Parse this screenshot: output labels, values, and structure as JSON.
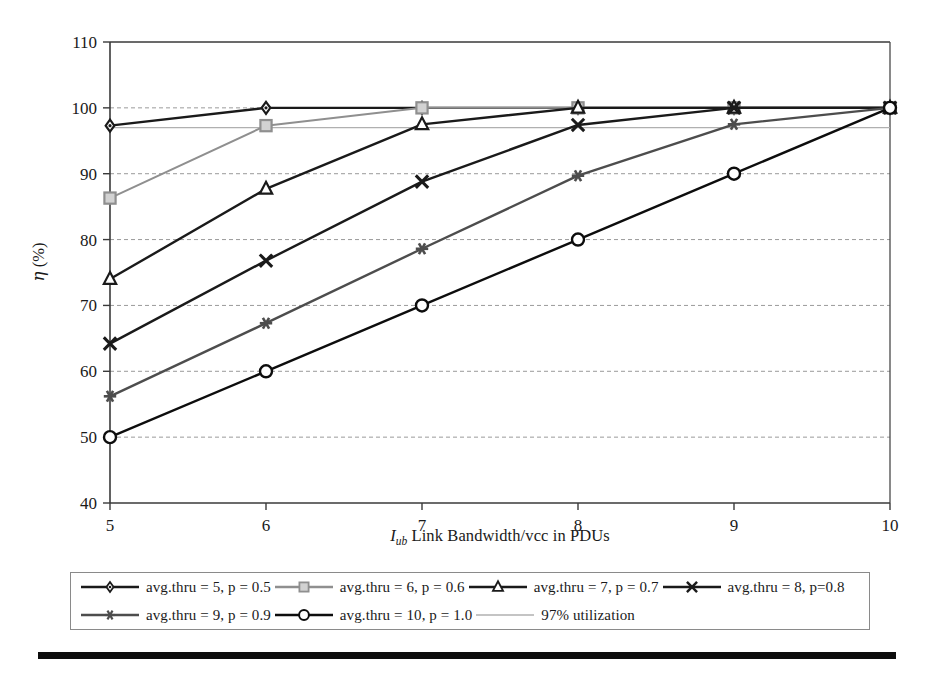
{
  "chart_data": {
    "type": "line",
    "title": "",
    "xlabel": "I_ub Link Bandwidth/vcc in PDUs",
    "xlabel_parts": {
      "italic": "I",
      "subscript": "ub",
      "rest": " Link Bandwidth/vcc in PDUs"
    },
    "ylabel": "η (%)",
    "ylabel_parts": {
      "symbol": "η",
      "unit": " (%)"
    },
    "x": [
      5,
      6,
      7,
      8,
      9,
      10
    ],
    "xlim": [
      5,
      10
    ],
    "ylim": [
      40,
      110
    ],
    "xticks": [
      "5",
      "6",
      "7",
      "8",
      "9",
      "10"
    ],
    "yticks": [
      "40",
      "50",
      "60",
      "70",
      "80",
      "90",
      "100",
      "110"
    ],
    "grid": "horizontal",
    "legend_position": "bottom",
    "series": [
      {
        "name": "avg.thru = 5, p = 0.5",
        "marker": "diamond",
        "color": "#1a1a1a",
        "values": [
          97.3,
          100.0,
          100.0,
          100.0,
          100.0,
          100.0
        ]
      },
      {
        "name": "avg.thru = 6, p = 0.6",
        "marker": "square",
        "color": "#8f8f8f",
        "values": [
          86.3,
          97.3,
          100.0,
          100.0,
          100.0,
          100.0
        ]
      },
      {
        "name": "avg.thru = 7, p = 0.7",
        "marker": "triangle",
        "color": "#1a1a1a",
        "values": [
          74.0,
          87.7,
          97.5,
          100.0,
          100.0,
          100.0
        ]
      },
      {
        "name": "avg.thru = 8, p=0.8",
        "marker": "x",
        "color": "#1a1a1a",
        "values": [
          64.2,
          76.8,
          88.8,
          97.4,
          100.0,
          100.0
        ]
      },
      {
        "name": "avg.thru = 9, p = 0.9",
        "marker": "asterisk",
        "color": "#4d4d4d",
        "values": [
          56.2,
          67.3,
          78.6,
          89.7,
          97.5,
          100.0
        ]
      },
      {
        "name": "avg.thru = 10, p = 1.0",
        "marker": "circle",
        "color": "#0d0d0d",
        "values": [
          50.0,
          60.0,
          70.0,
          80.0,
          90.0,
          100.0
        ]
      }
    ],
    "reference_lines": [
      {
        "name": "97% utilization",
        "value": 97,
        "color": "#b0b0b0",
        "marker": "none"
      }
    ]
  },
  "legend": {
    "rows": [
      [
        {
          "label": "avg.thru = 5, p = 0.5",
          "marker": "diamond",
          "color": "#1a1a1a"
        },
        {
          "label": "avg.thru = 6, p = 0.6",
          "marker": "square",
          "color": "#8f8f8f"
        },
        {
          "label": "avg.thru = 7, p = 0.7",
          "marker": "triangle",
          "color": "#1a1a1a"
        },
        {
          "label": "avg.thru = 8, p=0.8",
          "marker": "x",
          "color": "#1a1a1a"
        }
      ],
      [
        {
          "label": "avg.thru = 9, p = 0.9",
          "marker": "asterisk",
          "color": "#4d4d4d"
        },
        {
          "label": "avg.thru = 10, p = 1.0",
          "marker": "circle",
          "color": "#0d0d0d"
        },
        {
          "label": "97% utilization",
          "marker": "none",
          "color": "#b0b0b0"
        }
      ]
    ]
  }
}
